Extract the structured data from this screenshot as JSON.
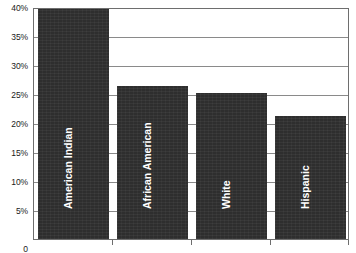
{
  "chart_data": {
    "type": "bar",
    "title": "",
    "subtitle": "",
    "xlabel": "",
    "ylabel": "",
    "categories": [
      "American Indian",
      "African American",
      "White",
      "Hispanic"
    ],
    "values": [
      39.7,
      26.3,
      25.2,
      21.2
    ],
    "value_unit": "%",
    "ylim": [
      0,
      40
    ],
    "y_tick_values": [
      0,
      5,
      10,
      15,
      20,
      25,
      30,
      35,
      40
    ],
    "y_tick_labels": [
      "0",
      "5%",
      "10%",
      "15%",
      "20%",
      "25%",
      "30%",
      "35%",
      "40%"
    ],
    "grid": true,
    "grid_axis": "y",
    "legend": false,
    "legend_position": "none",
    "bar_color": "#2e2e2e",
    "bar_label_color": "#ffffff",
    "bar_label_rotation": -90,
    "grid_color": "#8a8a8a",
    "axis_color": "#6e6e6e",
    "background_color": "#ffffff",
    "x_tick_marks_only": true,
    "bars": [
      {
        "category": "American Indian",
        "value": 39.7,
        "label": "American Indian"
      },
      {
        "category": "African American",
        "value": 26.3,
        "label": "African American"
      },
      {
        "category": "White",
        "value": 25.2,
        "label": "White"
      },
      {
        "category": "Hispanic",
        "value": 21.2,
        "label": "Hispanic"
      }
    ]
  }
}
